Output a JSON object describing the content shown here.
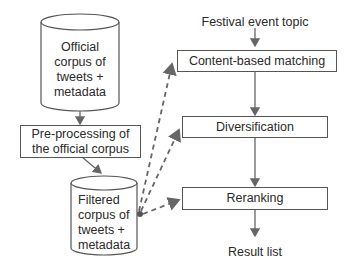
{
  "diagram": {
    "nodes": {
      "official_corpus": "Official\ncorpus of\ntweets +\nmetadata",
      "preprocessing": "Pre-processing of\nthe official corpus",
      "filtered_corpus": "Filtered\ncorpus of\ntweets +\nmetadata",
      "topic": "Festival event topic",
      "content_matching": "Content-based matching",
      "diversification": "Diversification",
      "reranking": "Reranking",
      "result": "Result list"
    },
    "edges": [
      {
        "from": "official_corpus",
        "to": "preprocessing",
        "style": "solid"
      },
      {
        "from": "preprocessing",
        "to": "filtered_corpus",
        "style": "solid"
      },
      {
        "from": "topic",
        "to": "content_matching",
        "style": "solid"
      },
      {
        "from": "content_matching",
        "to": "diversification",
        "style": "solid"
      },
      {
        "from": "diversification",
        "to": "reranking",
        "style": "solid"
      },
      {
        "from": "reranking",
        "to": "result",
        "style": "solid"
      },
      {
        "from": "filtered_corpus",
        "to": "content_matching",
        "style": "dashed"
      },
      {
        "from": "filtered_corpus",
        "to": "diversification",
        "style": "dashed"
      },
      {
        "from": "filtered_corpus",
        "to": "reranking",
        "style": "dashed"
      }
    ],
    "colors": {
      "line": "#555555",
      "dashed": "#666666",
      "text": "#2a2a2a"
    }
  }
}
